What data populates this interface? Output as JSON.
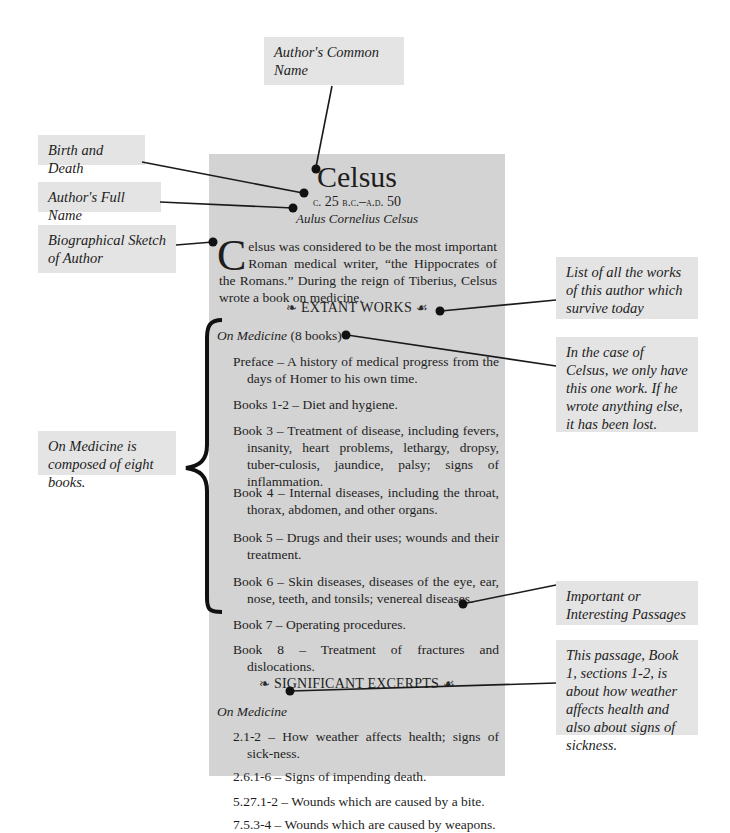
{
  "callouts": {
    "common_name": "Author's Common Name",
    "birth_death": "Birth and Death",
    "full_name": "Author's Full Name",
    "bio_sketch": "Biographical Sketch of Author",
    "extant_list": "List of all the works of this author which survive today",
    "one_work": "In the case of Celsus, we only have this one work. If he wrote anything else, it has been lost.",
    "eight_books": "On Medicine is composed of eight books.",
    "passages": "Important or Interesting Passages",
    "passage_note": "This passage, Book 1, sections 1-2, is about how weather affects health and also about signs of sickness."
  },
  "entry": {
    "name": "Celsus",
    "dates_prefix": "c.",
    "dates_value1": " 25 ",
    "dates_era1": "b.c.",
    "dates_sep": "–",
    "dates_era2": "a.d.",
    "dates_value2": " 50",
    "full_name": "Aulus Cornelius Celsus",
    "bio_dropcap": "C",
    "bio_text": "elsus was considered to be the most important Roman medical writer, “the Hippocrates of the Romans.” During the reign of Tiberius, Celsus wrote a book on medicine.",
    "extant_heading": "EXTANT WORKS",
    "ornament_left": "❧",
    "ornament_right": "☙",
    "work_title": "On Medicine",
    "work_count": " (8 books)",
    "books": [
      "Preface – A history of medical progress from the days of Homer to his own time.",
      "Books 1-2 – Diet and hygiene.",
      "Book 3 – Treatment of disease, including fevers, insanity, heart problems, lethargy, dropsy, tuber-culosis, jaundice, palsy; signs of inflammation.",
      "Book 4 – Internal diseases, including the throat, thorax, abdomen, and other organs.",
      "Book 5 – Drugs and their uses; wounds and their treatment.",
      "Book 6 – Skin diseases, diseases of the eye, ear, nose, teeth, and tonsils; venereal diseases.",
      "Book 7 – Operating procedures.",
      "Book 8 – Treatment of fractures and dislocations."
    ],
    "excerpts_heading": "SIGNIFICANT EXCERPTS",
    "excerpts_work": "On Medicine",
    "excerpts": [
      "2.1-2 – How weather affects health; signs of sick-ness.",
      "2.6.1-6 – Signs of impending death.",
      "5.27.1-2 – Wounds which are caused by a bite.",
      "7.5.3-4 – Wounds which are caused by weapons."
    ]
  }
}
